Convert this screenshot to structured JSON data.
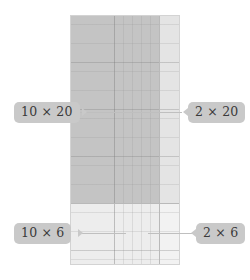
{
  "diagram": {
    "product": "12 × 26",
    "colors": {
      "background": "#ffffff",
      "badge_fill": "#c9c9c9",
      "badge_text": "#3a3a3a",
      "leader_line": "#bfbfbf",
      "divider": "#b9b9b9",
      "outline": "#d3d3d3",
      "quad_top_left": "#c4c4c4",
      "quad_top_right": "#e4e4e4",
      "quad_bottom_left": "#ededed",
      "quad_bottom_right": "#f2f2f2",
      "grid_fine": "#d8d8d8",
      "grid_heavy": "#c4c4c4"
    },
    "grid": {
      "columns_left": 10,
      "columns_right": 2,
      "rows_top": 20,
      "rows_bottom": 6,
      "total_columns": 12,
      "total_rows": 26
    },
    "quadrants": [
      {
        "id": "top-left",
        "label": "10 × 20",
        "width_units": 10,
        "height_units": 20,
        "area": 200,
        "shade": "#c4c4c4"
      },
      {
        "id": "top-right",
        "label": "2 × 20",
        "width_units": 2,
        "height_units": 20,
        "area": 40,
        "shade": "#e4e4e4"
      },
      {
        "id": "bottom-left",
        "label": "10 × 6",
        "width_units": 10,
        "height_units": 6,
        "area": 60,
        "shade": "#ededed"
      },
      {
        "id": "bottom-right",
        "label": "2 × 6",
        "width_units": 2,
        "height_units": 6,
        "area": 12,
        "shade": "#f2f2f2"
      }
    ],
    "labels": {
      "top_left": "10 × 20",
      "top_right": "2 × 20",
      "bottom_left": "10 × 6",
      "bottom_right": "2 × 6"
    }
  }
}
